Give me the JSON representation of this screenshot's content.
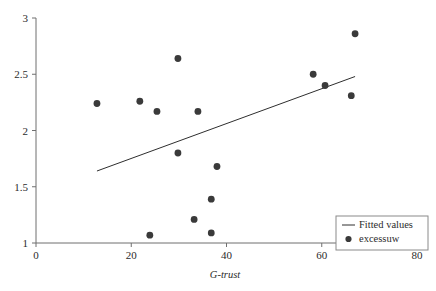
{
  "chart_data": {
    "type": "scatter",
    "title": "",
    "subtitle": "",
    "xlabel": "G-trust",
    "ylabel": "",
    "xlim": [
      0,
      80
    ],
    "ylim": [
      1,
      3
    ],
    "grid": false,
    "legend_position": "bottom-right",
    "x_ticks": [
      {
        "value": 0,
        "label": "0"
      },
      {
        "value": 20,
        "label": "20"
      },
      {
        "value": 40,
        "label": "40"
      },
      {
        "value": 60,
        "label": "60"
      },
      {
        "value": 80,
        "label": "80"
      }
    ],
    "y_ticks": [
      {
        "value": 1,
        "label": "1"
      },
      {
        "value": 1.5,
        "label": "1.5"
      },
      {
        "value": 2,
        "label": "2"
      },
      {
        "value": 2.5,
        "label": "2.5"
      },
      {
        "value": 3,
        "label": "3"
      }
    ],
    "series": [
      {
        "name": "excessuw",
        "type": "scatter",
        "marker": "filled-circle",
        "color": "#3a3a3a",
        "points": [
          {
            "x": 12.8,
            "y": 2.24
          },
          {
            "x": 21.8,
            "y": 2.26
          },
          {
            "x": 23.9,
            "y": 1.07
          },
          {
            "x": 25.4,
            "y": 2.17
          },
          {
            "x": 29.8,
            "y": 2.64
          },
          {
            "x": 29.8,
            "y": 1.8
          },
          {
            "x": 33.2,
            "y": 1.21
          },
          {
            "x": 34.0,
            "y": 2.17
          },
          {
            "x": 36.8,
            "y": 1.39
          },
          {
            "x": 36.8,
            "y": 1.09
          },
          {
            "x": 38.0,
            "y": 1.68
          },
          {
            "x": 58.2,
            "y": 2.5
          },
          {
            "x": 60.7,
            "y": 2.4
          },
          {
            "x": 66.2,
            "y": 2.31
          },
          {
            "x": 67.0,
            "y": 2.86
          }
        ]
      },
      {
        "name": "Fitted values",
        "type": "line",
        "color": "#2e2e2e",
        "points": [
          {
            "x": 12.8,
            "y": 1.64
          },
          {
            "x": 67.0,
            "y": 2.48
          }
        ]
      }
    ],
    "legend": [
      {
        "label": "Fitted values",
        "marker": "line",
        "color": "#2e2e2e"
      },
      {
        "label": "excessuw",
        "marker": "filled-circle",
        "color": "#3a3a3a"
      }
    ]
  }
}
